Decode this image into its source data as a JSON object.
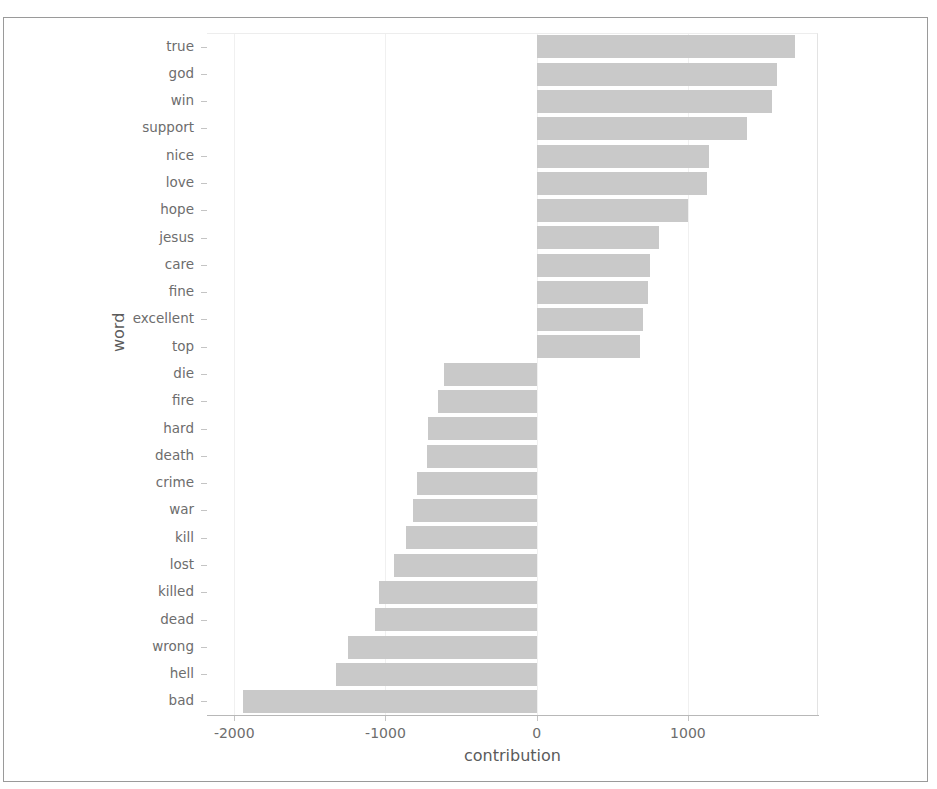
{
  "chart_data": {
    "type": "bar",
    "orientation": "horizontal",
    "title": "",
    "xlabel": "contribution",
    "ylabel": "word",
    "xlim": [
      -2180,
      1860
    ],
    "xticks": [
      -2000,
      -1000,
      0,
      1000
    ],
    "xtick_labels": [
      "-2000",
      "-1000",
      "0",
      "1000"
    ],
    "grid": true,
    "legend": null,
    "bar_color": "#c9c9c9",
    "categories": [
      "true",
      "god",
      "win",
      "support",
      "nice",
      "love",
      "hope",
      "jesus",
      "care",
      "fine",
      "excellent",
      "top",
      "die",
      "fire",
      "hard",
      "death",
      "crime",
      "war",
      "kill",
      "lost",
      "killed",
      "dead",
      "wrong",
      "hell",
      "bad"
    ],
    "values": [
      1710,
      1590,
      1555,
      1390,
      1140,
      1125,
      1000,
      810,
      750,
      735,
      705,
      685,
      -615,
      -650,
      -720,
      -725,
      -790,
      -820,
      -865,
      -945,
      -1045,
      -1070,
      -1245,
      -1330,
      -1945
    ]
  },
  "axis": {
    "x_title": "contribution",
    "y_title": "word"
  }
}
